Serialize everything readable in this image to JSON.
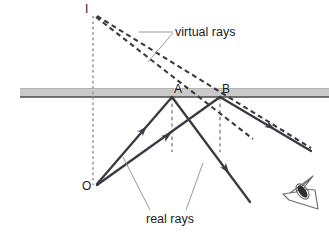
{
  "figure": {
    "type": "optics-ray-diagram",
    "background_color": "#ffffff",
    "mirror": {
      "name": "mirror-surface",
      "fill_color": "#c9c9c9",
      "top_edge_color": "#b0b0b0",
      "bottom_edge_color": "#4a4a4a",
      "x_start": 20,
      "x_end": 329,
      "y_top": 88,
      "y_bottom": 97
    },
    "points": [
      {
        "id": "I",
        "label": "I",
        "x": 93,
        "y": 15,
        "label_x": 86,
        "label_y": 4,
        "kind": "virtual-image"
      },
      {
        "id": "A",
        "label": "A",
        "x": 172,
        "y": 97,
        "label_x": 175,
        "label_y": 84,
        "kind": "reflection-point"
      },
      {
        "id": "B",
        "label": "B",
        "x": 220,
        "y": 97,
        "label_x": 223,
        "label_y": 84,
        "kind": "reflection-point"
      },
      {
        "id": "O",
        "label": "O",
        "x": 95,
        "y": 186,
        "label_x": 84,
        "label_y": 180,
        "kind": "object"
      }
    ],
    "annotations": [
      {
        "id": "virtual-rays",
        "text": "virtual rays",
        "x": 175,
        "y": 25
      },
      {
        "id": "real-rays",
        "text": "real rays",
        "x": 146,
        "y": 212
      }
    ],
    "colors": {
      "ray_stroke": "#3a3a44",
      "dashed_ray_stroke": "#3a3a44",
      "construction_dash": "#9a9a9a",
      "leader_line": "#8d8d8d",
      "eye_stroke": "#6d6d6d",
      "pupil_fill": "#303030"
    },
    "ray_paths": {
      "virtual_ray_IA": "I to A extended to lower-right (dashed)",
      "virtual_ray_IB": "I to B extended to lower-right (dashed)",
      "real_ray_OA": "O to A (solid, arrow)",
      "real_ray_OB": "O to B (solid, arrow)",
      "reflected_ray_A": "A to lower-right (solid, arrow)",
      "reflected_ray_B": "B to lower-right (solid, arrow)",
      "normal_at_A": "vertical dashed from A downward",
      "normal_at_B": "vertical dashed from B downward",
      "axis_IO": "vertical dashed from I through mirror to O"
    },
    "eye": {
      "id": "observer-eye",
      "x": 300,
      "y": 198
    }
  }
}
